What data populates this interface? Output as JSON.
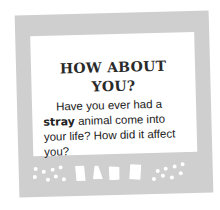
{
  "card": {
    "heading_line1": "HOW ABOUT",
    "heading_line2": "YOU?",
    "body_pre": "Have you ever had a ",
    "body_emphasis": "stray",
    "body_post": " animal come into your life? How did it affect you?"
  },
  "colors": {
    "frame": "#cfcfcf",
    "panel": "#ffffff",
    "text": "#222222"
  }
}
